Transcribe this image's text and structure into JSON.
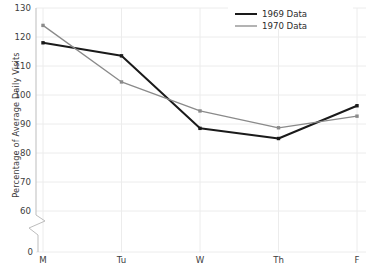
{
  "chart_data": {
    "type": "line",
    "title": "",
    "xlabel": "",
    "ylabel": "Percentage of Average Daily Visits",
    "categories": [
      "M",
      "Tu",
      "W",
      "Th",
      "F"
    ],
    "ylim": [
      60,
      130
    ],
    "y_ticks": [
      60,
      70,
      80,
      90,
      100,
      110,
      120,
      130
    ],
    "y_axis_break": true,
    "y_origin_label": "0",
    "grid": true,
    "legend_position": "top-right",
    "series": [
      {
        "name": "1969 Data",
        "color": "#1a1a1a",
        "line_width": 2.0,
        "markers": true,
        "values": [
          118.0,
          113.5,
          88.5,
          85.0,
          96.3
        ]
      },
      {
        "name": "1970 Data",
        "color": "#8a8a8a",
        "line_width": 1.3,
        "markers": true,
        "values": [
          124.0,
          104.5,
          94.5,
          88.7,
          92.7
        ]
      }
    ]
  },
  "axis": {
    "y_title": "Percentage of Average Daily Visits",
    "y_tick_labels": [
      "130",
      "120",
      "110",
      "100",
      "90",
      "80",
      "70",
      "60",
      "0"
    ],
    "x_tick_labels": [
      "M",
      "Tu",
      "W",
      "Th",
      "F"
    ]
  },
  "legend": {
    "items": [
      {
        "label": "1969 Data"
      },
      {
        "label": "1970 Data"
      }
    ]
  },
  "colors": {
    "series_1969": "#1a1a1a",
    "series_1970": "#8a8a8a",
    "grid": "#ececec",
    "axis": "#bdbdbd",
    "text": "#3d3d3d"
  }
}
